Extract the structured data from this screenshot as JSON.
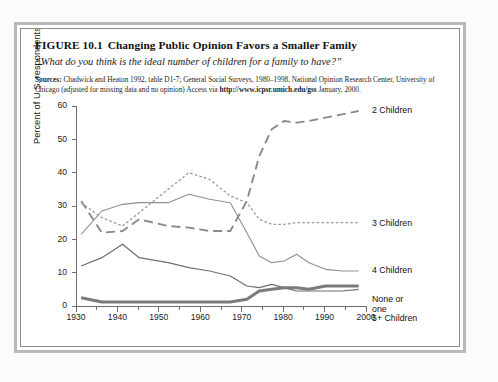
{
  "figure": {
    "number": "FIGURE 10.1",
    "title": "Changing Public Opinion Favors a Smaller Family",
    "subtitle": "“What do you think is the ideal number of children for a family to have?”",
    "sources_label": "Sources:",
    "sources_line1": "Chadwick and Heaton 1992, table D1-7; General Social Surveys, 1980–1998, National Opinion",
    "sources_line2": "Research Center, University of Chicago (adjusted for missing data and no opinion) Access via ",
    "sources_url1": "http://www.",
    "sources_url2": "icpsr.umich.edu/gss",
    "sources_line3": " January, 2000."
  },
  "chart_data": {
    "type": "line",
    "title": "Changing Public Opinion Favors a Smaller Family",
    "xlabel": "",
    "ylabel": "Percent of U.S. respondents",
    "xlim": [
      1930,
      2000
    ],
    "ylim": [
      0,
      60
    ],
    "ytick_values": [
      0,
      10,
      20,
      30,
      40,
      50,
      60
    ],
    "xtick_values": [
      1930,
      1940,
      1950,
      1960,
      1970,
      1980,
      1990,
      2000
    ],
    "xtick_minor_values": [
      1935,
      1945,
      1955,
      1965,
      1975,
      1985,
      1995
    ],
    "grid": false,
    "legend_position": "right-inline",
    "series": [
      {
        "name": "2 Children",
        "style": "dashed-long",
        "color": "#8a8a8a",
        "width": 1.9,
        "x": [
          1931,
          1936,
          1941,
          1945,
          1952,
          1957,
          1962,
          1967,
          1971,
          1974,
          1977,
          1980,
          1983,
          1986,
          1990,
          1994,
          1998
        ],
        "y": [
          31.5,
          22.0,
          22.5,
          26.0,
          24.0,
          23.5,
          22.5,
          22.5,
          31.5,
          45.0,
          53.0,
          55.5,
          55.0,
          55.5,
          56.5,
          57.5,
          58.5
        ]
      },
      {
        "name": "3 Children",
        "style": "dashed-short",
        "color": "#9a9a9a",
        "width": 1.3,
        "x": [
          1931,
          1936,
          1941,
          1945,
          1952,
          1957,
          1962,
          1967,
          1971,
          1974,
          1977,
          1980,
          1983,
          1986,
          1990,
          1994,
          1998
        ],
        "y": [
          31.0,
          26.5,
          24.0,
          28.0,
          35.0,
          40.0,
          38.0,
          33.0,
          31.0,
          26.0,
          24.5,
          24.5,
          25.0,
          25.0,
          25.0,
          25.0,
          25.0
        ]
      },
      {
        "name": "4 Children",
        "style": "solid-thin",
        "color": "#8f8f8f",
        "width": 1.1,
        "x": [
          1931,
          1936,
          1941,
          1945,
          1952,
          1957,
          1962,
          1967,
          1971,
          1974,
          1977,
          1980,
          1983,
          1986,
          1990,
          1994,
          1998
        ],
        "y": [
          21.5,
          28.5,
          30.5,
          31.0,
          31.0,
          33.5,
          32.0,
          31.0,
          22.0,
          15.0,
          13.0,
          13.5,
          15.5,
          13.0,
          11.0,
          10.5,
          10.5
        ]
      },
      {
        "name": "None or one",
        "style": "solid-thin",
        "color": "#6f6f6f",
        "width": 1.2,
        "x": [
          1931,
          1936,
          1941,
          1945,
          1952,
          1957,
          1962,
          1967,
          1971,
          1974,
          1977,
          1980,
          1983,
          1986,
          1990,
          1994,
          1998
        ],
        "y": [
          12.0,
          14.5,
          18.5,
          14.5,
          13.0,
          11.5,
          10.5,
          9.0,
          6.0,
          5.5,
          6.5,
          5.5,
          4.5,
          4.5,
          4.5,
          4.5,
          5.0
        ]
      },
      {
        "name": "5+ Children",
        "style": "solid-thick",
        "color": "#7a7a7a",
        "width": 3.0,
        "x": [
          1931,
          1936,
          1941,
          1945,
          1952,
          1957,
          1962,
          1967,
          1971,
          1974,
          1977,
          1980,
          1983,
          1986,
          1990,
          1994,
          1998
        ],
        "y": [
          2.5,
          1.2,
          1.2,
          1.2,
          1.2,
          1.2,
          1.2,
          1.2,
          2.0,
          4.5,
          5.0,
          5.5,
          5.5,
          5.0,
          6.0,
          6.0,
          6.0
        ]
      }
    ],
    "legend_entries": [
      {
        "label": "2 Children",
        "value_at_end": 58.5
      },
      {
        "label": "3 Children",
        "value_at_end": 25.0
      },
      {
        "label": "4 Children",
        "value_at_end": 10.5
      },
      {
        "label": "None or one",
        "value_at_end": 5.0
      },
      {
        "label": "5+ Children",
        "value_at_end": 6.0
      }
    ],
    "legend_labels_rendered": [
      "2 Children",
      "3 Children",
      "4 Children",
      "None or",
      "one",
      "5+ Children"
    ]
  },
  "colors": {
    "frame_outer": "#b9b9b6",
    "frame_inner": "#8e8e8b",
    "axis": "#6d6d6d",
    "text": "#111111",
    "page_bg": "#fbfbfa"
  }
}
